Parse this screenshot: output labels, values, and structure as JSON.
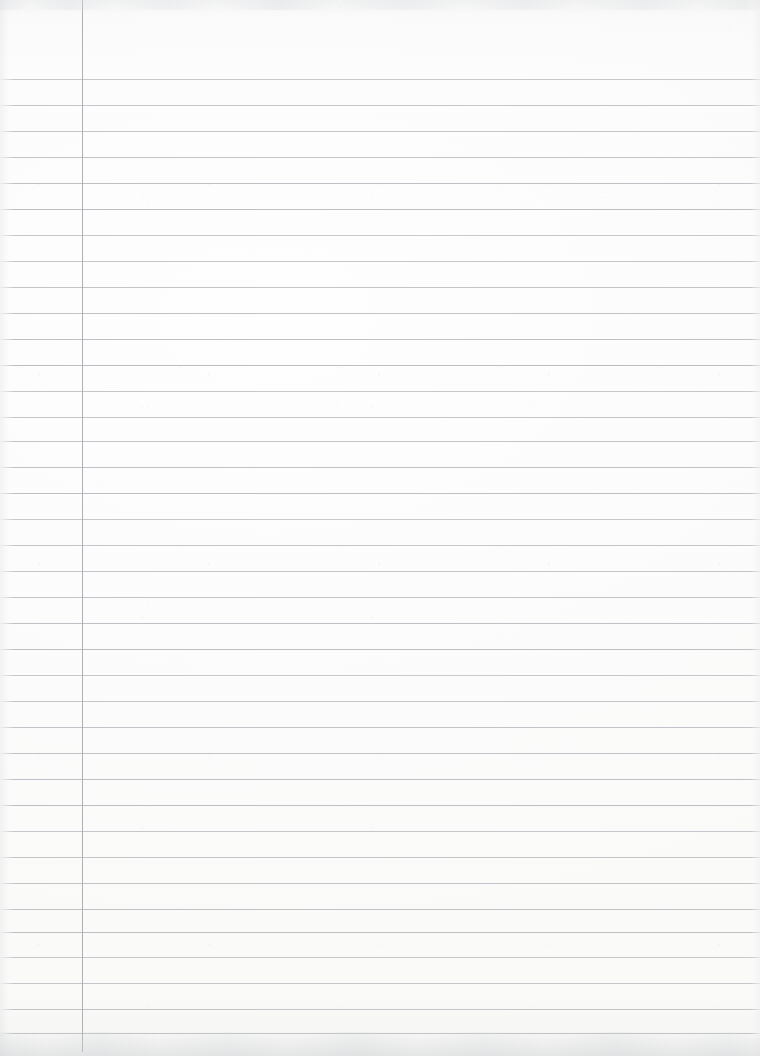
{
  "document": {
    "kind": "scanned-lined-notebook-page",
    "title": "Lined notebook paper",
    "content_text": "",
    "is_blank": true,
    "page_width": 760,
    "page_height": 1056
  },
  "paper": {
    "background_color": "#fdfdfd",
    "edge_shadow_color": "#dadcde",
    "grain_color": "#c8cacc"
  },
  "ruling": {
    "style": "wide-ruled",
    "line_color": "#b9bdc1",
    "line_thickness_px": 1,
    "line_spacing_px": 26,
    "first_line_y": 79,
    "line_count": 37,
    "line_y_positions": [
      79,
      105,
      131,
      157,
      183,
      209,
      235,
      261,
      287,
      313,
      339,
      365,
      391,
      417,
      441,
      467,
      493,
      519,
      545,
      571,
      597,
      623,
      649,
      675,
      701,
      727,
      753,
      779,
      805,
      831,
      857,
      883,
      909,
      932,
      957,
      983,
      1009,
      1033
    ]
  },
  "margin_rule": {
    "orientation": "vertical",
    "color": "#a9adb1",
    "thickness_px": 1,
    "x_position": 82,
    "top_y": 0,
    "bottom_y": 1052
  },
  "regions": {
    "header_area_label": "",
    "writing_area_label": "",
    "left_margin_label": ""
  }
}
